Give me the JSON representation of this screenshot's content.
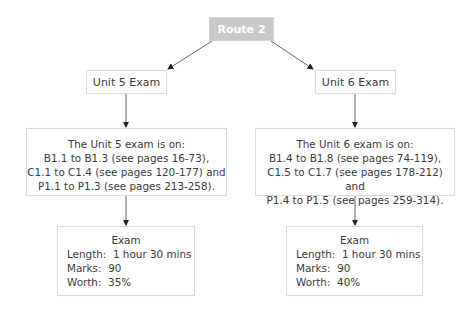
{
  "route": {
    "label": "Route 2",
    "fill": "#c9c9c9"
  },
  "left": {
    "unit_label": "Unit 5 Exam",
    "info_lines": [
      "The Unit 5 exam is on:",
      "B1.1 to B1.3 (see pages 16-73),",
      "C1.1 to C1.4 (see pages 120-177) and",
      "P1.1 to P1.3 (see pages 213-258)."
    ],
    "exam": {
      "title": "Exam",
      "length_label": "Length:",
      "length_value": "1 hour 30 mins",
      "marks_label": "Marks:",
      "marks_value": "90",
      "worth_label": "Worth:",
      "worth_value": "35%"
    }
  },
  "right": {
    "unit_label": "Unit 6 Exam",
    "info_lines": [
      "The Unit 6 exam is on:",
      "B1.4 to B1.8 (see pages 74-119),",
      "C1.5 to C1.7 (see pages 178-212) and",
      "P1.4 to P1.5 (see pages 259-314)."
    ],
    "exam": {
      "title": "Exam",
      "length_label": "Length:",
      "length_value": "1 hour 30 mins",
      "marks_label": "Marks:",
      "marks_value": "90",
      "worth_label": "Worth:",
      "worth_value": "40%"
    }
  }
}
